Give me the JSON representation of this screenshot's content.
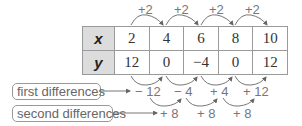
{
  "table": {
    "x_label": "x",
    "y_label": "y",
    "x_values": [
      "2",
      "4",
      "6",
      "8",
      "10"
    ],
    "y_values": [
      "12",
      "0",
      "−4",
      "0",
      "12"
    ]
  },
  "x_steps": [
    "+2",
    "+2",
    "+2",
    "+2"
  ],
  "first_differences": {
    "label": "first differences",
    "values": [
      "− 12",
      "− 4",
      "+ 4",
      "+ 12"
    ]
  },
  "second_differences": {
    "label": "second differences",
    "values": [
      "+ 8",
      "+ 8",
      "+ 8"
    ]
  },
  "colors": {
    "header_fill": "#dcdcdc",
    "border": "#9a9a9a",
    "arrow": "#777777",
    "annotation_text": "#777777"
  }
}
